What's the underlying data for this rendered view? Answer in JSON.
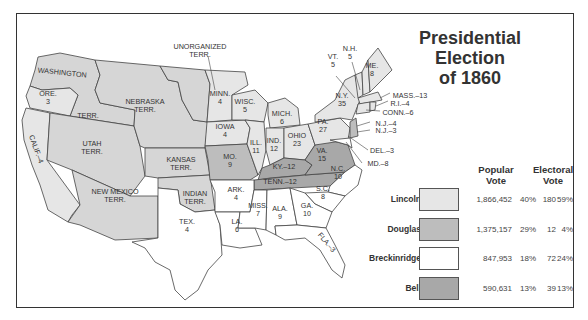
{
  "title": {
    "line1": "Presidential Election",
    "line2": "of 1860"
  },
  "colors": {
    "lincoln": "#e6e6e6",
    "douglas": "#bdbdbd",
    "breckinridge": "#ffffff",
    "bell": "#a8a8a8",
    "territory": "#d6d6d6",
    "border": "#444444"
  },
  "legend": {
    "popular_header": [
      "Popular",
      "Vote"
    ],
    "electoral_header": [
      "Electoral",
      "Vote"
    ],
    "rows": [
      {
        "candidate": "Lincoln",
        "popular": "1,866,452",
        "popular_pct": "40%",
        "electoral": "180",
        "electoral_pct": "59%"
      },
      {
        "candidate": "Douglas",
        "popular": "1,375,157",
        "popular_pct": "29%",
        "electoral": "12",
        "electoral_pct": "4%"
      },
      {
        "candidate": "Breckinridge",
        "popular": "847,953",
        "popular_pct": "18%",
        "electoral": "72",
        "electoral_pct": "24%"
      },
      {
        "candidate": "Bell",
        "popular": "590,631",
        "popular_pct": "13%",
        "electoral": "39",
        "electoral_pct": "13%"
      }
    ]
  },
  "map_labels": {
    "washington": "WASHINGTON",
    "washington_terr": "TERR.",
    "ore": "ORE.",
    "ore_v": "3",
    "calif": "CALIF.–4",
    "nebraska": "NEBRASKA",
    "nebraska2": "TERR.",
    "unorg": "UNORGANIZED",
    "unorg2": "TERR.",
    "utah": "UTAH",
    "utah2": "TERR.",
    "kansas": "KANSAS",
    "kansas2": "TERR.",
    "newmex": "NEW MEXICO",
    "newmex2": "TERR.",
    "indian": "INDIAN",
    "indian2": "TERR.",
    "tex": "TEX.",
    "tex_v": "4",
    "minn": "MINN.",
    "minn_v": "4",
    "iowa": "IOWA",
    "iowa_v": "4",
    "mo": "MO.",
    "mo_v": "9",
    "wisc": "WISC.",
    "wisc_v": "5",
    "ill": "ILL.",
    "ill_v": "11",
    "mich": "MICH.",
    "mich_v": "6",
    "ind": "IND.",
    "ind_v": "12",
    "ohio": "OHIO",
    "ohio_v": "23",
    "pa": "PA.",
    "pa_v": "27",
    "ny": "N.Y.",
    "ny_v": "35",
    "vt": "VT.",
    "vt_v": "5",
    "nh": "N.H.",
    "nh_v": "5",
    "me": "ME.",
    "me_v": "8",
    "mass": "MASS.–13",
    "ri": "R.I.–4",
    "conn": "CONN.–6",
    "nj1": "N.J.–4",
    "nj2": "N.J.–3",
    "del": "DEL.–3",
    "md": "MD.–8",
    "va": "VA.",
    "va_v": "15",
    "ky": "KY.–12",
    "tenn": "TENN.–12",
    "nc": "N.C.",
    "nc_v": "10",
    "sc": "S.C.",
    "sc_v": "8",
    "ark": "ARK.",
    "ark_v": "4",
    "la": "LA.",
    "la_v": "6",
    "miss": "MISS.",
    "miss_v": "7",
    "ala": "ALA.",
    "ala_v": "9",
    "ga": "GA.",
    "ga_v": "10",
    "fla": "FLA.–3"
  }
}
